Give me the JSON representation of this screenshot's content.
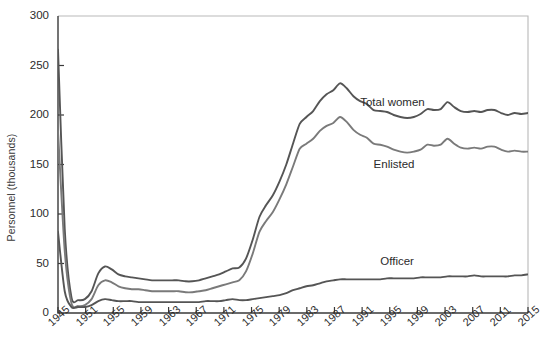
{
  "chart_data": {
    "type": "line",
    "title": "",
    "subtitle": "",
    "xlabel": "",
    "ylabel": "Personnel (thousands)",
    "xlim": [
      1945,
      2015
    ],
    "ylim": [
      0,
      300
    ],
    "yticks": [
      0,
      50,
      100,
      150,
      200,
      250,
      300
    ],
    "ytick_labels": [
      "0",
      "50",
      "100",
      "150",
      "200",
      "250",
      "300"
    ],
    "xticks": [
      1945,
      1951,
      1955,
      1959,
      1963,
      1967,
      1971,
      1975,
      1979,
      1983,
      1987,
      1991,
      1995,
      1999,
      2003,
      2007,
      2011,
      2015
    ],
    "xtick_labels": [
      "1945",
      "1951",
      "1955",
      "1959",
      "1963",
      "1967",
      "1971",
      "1975",
      "1979",
      "1983",
      "1987",
      "1991",
      "1995",
      "1999",
      "2003",
      "2007",
      "2011",
      "2015"
    ],
    "grid": false,
    "legend_position": "inline-annotation",
    "x": [
      1945,
      1946,
      1947,
      1948,
      1949,
      1950,
      1951,
      1952,
      1953,
      1954,
      1955,
      1956,
      1957,
      1958,
      1959,
      1960,
      1961,
      1962,
      1963,
      1964,
      1965,
      1966,
      1967,
      1968,
      1969,
      1970,
      1971,
      1972,
      1973,
      1974,
      1975,
      1976,
      1977,
      1978,
      1979,
      1980,
      1981,
      1982,
      1983,
      1984,
      1985,
      1986,
      1987,
      1988,
      1989,
      1990,
      1991,
      1992,
      1993,
      1994,
      1995,
      1996,
      1997,
      1998,
      1999,
      2000,
      2001,
      2002,
      2003,
      2004,
      2005,
      2006,
      2007,
      2008,
      2009,
      2010,
      2011,
      2012,
      2013,
      2014,
      2015
    ],
    "series": [
      {
        "name": "Total women",
        "color": "#555555",
        "label_x": 1990,
        "label_y": 212,
        "values": [
          266,
          85,
          16,
          13,
          14,
          22,
          40,
          47,
          44,
          39,
          37,
          36,
          35,
          34,
          33,
          33,
          33,
          33,
          33,
          32,
          32,
          33,
          35,
          37,
          39,
          42,
          45,
          46,
          55,
          74,
          97,
          109,
          119,
          133,
          150,
          171,
          191,
          198,
          204,
          214,
          221,
          225,
          232,
          227,
          219,
          214,
          211,
          205,
          204,
          203,
          200,
          198,
          197,
          198,
          201,
          206,
          205,
          206,
          213,
          208,
          204,
          203,
          204,
          203,
          205,
          205,
          202,
          200,
          202,
          201,
          202
        ]
      },
      {
        "name": "Enlisted",
        "color": "#7a7a7a",
        "label_x": 1992,
        "label_y": 150,
        "values": [
          184,
          63,
          10,
          7,
          8,
          14,
          28,
          33,
          31,
          27,
          25,
          24,
          24,
          23,
          22,
          22,
          22,
          22,
          22,
          21,
          21,
          22,
          23,
          25,
          27,
          29,
          31,
          33,
          42,
          60,
          82,
          93,
          102,
          115,
          130,
          148,
          166,
          171,
          176,
          184,
          189,
          192,
          198,
          193,
          185,
          180,
          177,
          171,
          170,
          168,
          165,
          163,
          162,
          163,
          165,
          170,
          169,
          170,
          176,
          171,
          167,
          166,
          167,
          166,
          168,
          168,
          165,
          163,
          164,
          163,
          163
        ]
      },
      {
        "name": "Officer",
        "color": "#555555",
        "label_x": 1993,
        "label_y": 52,
        "values": [
          82,
          22,
          6,
          6,
          6,
          8,
          12,
          14,
          13,
          12,
          12,
          12,
          11,
          11,
          11,
          11,
          11,
          11,
          11,
          11,
          11,
          11,
          12,
          12,
          12,
          13,
          14,
          13,
          13,
          14,
          15,
          16,
          17,
          18,
          20,
          23,
          25,
          27,
          28,
          30,
          32,
          33,
          34,
          34,
          34,
          34,
          34,
          34,
          34,
          35,
          35,
          35,
          35,
          35,
          36,
          36,
          36,
          36,
          37,
          37,
          37,
          37,
          38,
          37,
          37,
          37,
          37,
          37,
          38,
          38,
          39
        ]
      }
    ]
  },
  "axis": {
    "y_axis_title": "Personnel (thousands)"
  }
}
